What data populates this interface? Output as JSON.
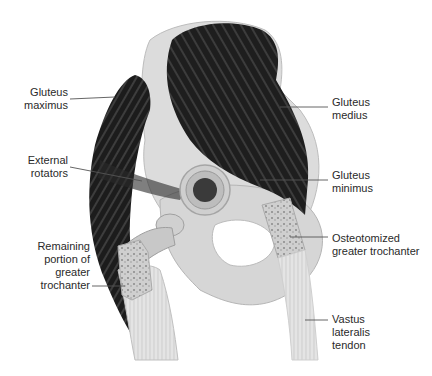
{
  "figure": {
    "type": "anatomical illustration",
    "colors": {
      "muscle": "#1e1e1e",
      "muscle_fiber": "#6a6a6a",
      "bone": "#dcdcdc",
      "bone_shadow": "#b8b8b8",
      "leader_line": "#555555",
      "text": "#2a2a2a",
      "background": "#ffffff"
    }
  },
  "labels": {
    "gluteus_maximus": "Gluteus\nmaximus",
    "external_rotators": "External\nrotators",
    "remaining_portion": "Remaining\nportion of\ngreater\ntrochanter",
    "gluteus_medius": "Gluteus\nmedius",
    "gluteus_minimus": "Gluteus\nminimus",
    "osteotomized": "Osteotomized\ngreater trochanter",
    "vastus_lateralis": "Vastus\nlateralis\ntendon"
  }
}
